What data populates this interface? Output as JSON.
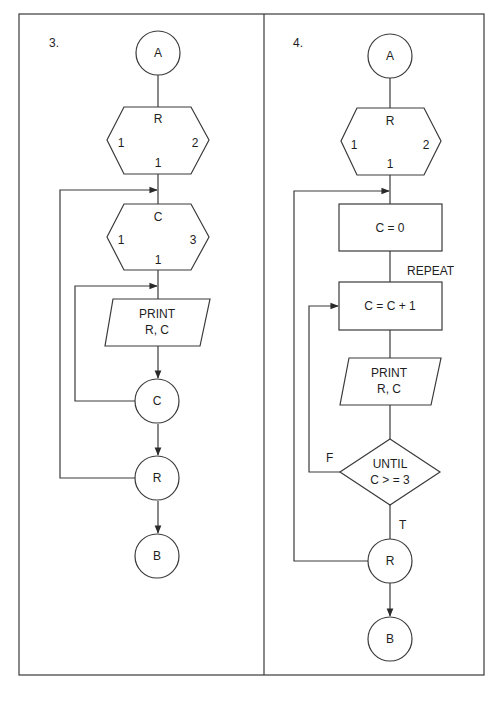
{
  "panels": [
    {
      "number": "3.",
      "start_connector": "A",
      "loop_outer": {
        "var": "R",
        "start": "1",
        "end": "2",
        "step": "1"
      },
      "loop_inner": {
        "var": "C",
        "start": "1",
        "end": "3",
        "step": "1"
      },
      "print": {
        "line1": "PRINT",
        "line2": "R, C"
      },
      "inner_end": "C",
      "outer_end": "R",
      "end_connector": "B"
    },
    {
      "number": "4.",
      "start_connector": "A",
      "loop_outer": {
        "var": "R",
        "start": "1",
        "end": "2",
        "step": "1"
      },
      "init": "C = 0",
      "repeat_label": "REPEAT",
      "increment": "C = C + 1",
      "print": {
        "line1": "PRINT",
        "line2": "R, C"
      },
      "decision": {
        "line1": "UNTIL",
        "line2": "C > = 3",
        "false_label": "F",
        "true_label": "T"
      },
      "outer_end": "R",
      "end_connector": "B"
    }
  ],
  "colors": {
    "line": "#3a3a3a",
    "text": "#1e1e1e",
    "background": "#ffffff"
  }
}
